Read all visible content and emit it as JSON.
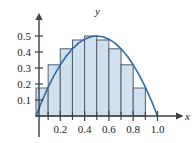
{
  "chart_data": {
    "type": "bar",
    "title": "",
    "subtitle": "",
    "xlabel": "x",
    "ylabel": "y",
    "xlim": [
      0.0,
      1.05
    ],
    "ylim": [
      0.0,
      0.56
    ],
    "grid": false,
    "legend": null,
    "bar_width": 0.1,
    "note": "Midpoint Riemann sum rectangles under the parabola y = 2x(1-x) on [0,0.9]",
    "categories": [
      "0.0-0.1",
      "0.1-0.2",
      "0.2-0.3",
      "0.3-0.4",
      "0.4-0.5",
      "0.5-0.6",
      "0.6-0.7",
      "0.7-0.8",
      "0.8-0.9"
    ],
    "bar_left_edges": [
      0.0,
      0.1,
      0.2,
      0.3,
      0.4,
      0.5,
      0.6,
      0.7,
      0.8
    ],
    "bar_right_edges": [
      0.1,
      0.2,
      0.3,
      0.4,
      0.5,
      0.6,
      0.7,
      0.8,
      0.9
    ],
    "values": [
      0.175,
      0.32,
      0.42,
      0.475,
      0.5,
      0.475,
      0.42,
      0.32,
      0.175
    ],
    "curve": {
      "name": "y = 2x(1 - x)",
      "x": [
        0.0,
        0.05,
        0.1,
        0.15,
        0.2,
        0.25,
        0.3,
        0.35,
        0.4,
        0.45,
        0.5,
        0.55,
        0.6,
        0.65,
        0.7,
        0.75,
        0.8,
        0.85,
        0.9,
        0.95,
        1.0
      ],
      "y": [
        0.0,
        0.095,
        0.18,
        0.255,
        0.32,
        0.375,
        0.42,
        0.455,
        0.48,
        0.495,
        0.5,
        0.495,
        0.48,
        0.455,
        0.42,
        0.375,
        0.32,
        0.255,
        0.18,
        0.095,
        0.0
      ]
    },
    "x_ticks": [
      0.2,
      0.4,
      0.6,
      0.8,
      1.0
    ],
    "x_tick_labels": [
      "0.2",
      "0.4",
      "0.6",
      "0.8",
      "1.0"
    ],
    "x_minor_ticks": [
      0.1,
      0.3,
      0.5,
      0.7,
      0.9
    ],
    "y_ticks": [
      0.1,
      0.2,
      0.3,
      0.4,
      0.5
    ],
    "y_tick_labels": [
      "0.1",
      "0.2",
      "0.3",
      "0.4",
      "0.5"
    ],
    "colors": {
      "bar_fill": "#cfe0ee",
      "bar_stroke": "#565c68",
      "curve": "#2d6ca8",
      "axis": "#3a3f48",
      "text": "#1a1a1a",
      "background": "#ffffff"
    }
  }
}
